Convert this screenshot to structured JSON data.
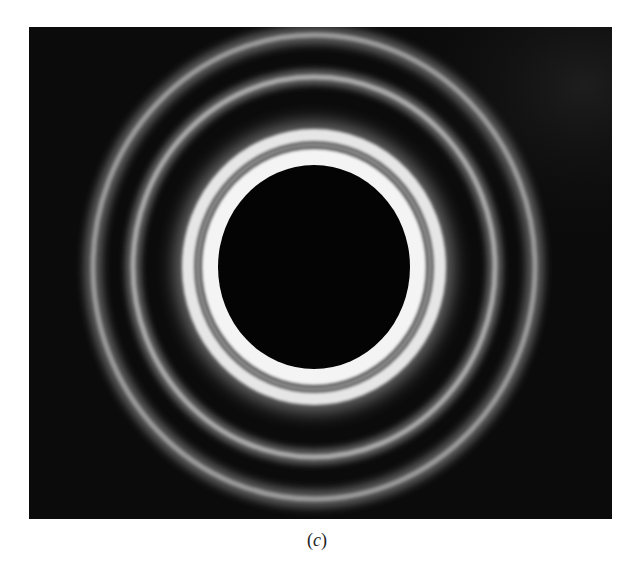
{
  "figure": {
    "background_color": "#0b0b0b",
    "center": {
      "x": 285,
      "y": 240
    },
    "rings": [
      {
        "name": "central-dark-disc",
        "rx": 96,
        "ry": 102,
        "color": "#050505"
      },
      {
        "name": "bright-inner-ring-a",
        "rx": 106,
        "ry": 112,
        "color": "#f2f2f2"
      },
      {
        "name": "bright-inner-ring-b",
        "rx": 124,
        "ry": 130,
        "color": "#e8e8e8"
      },
      {
        "name": "middle-ring",
        "rx": 180,
        "ry": 190,
        "color": "#9a9a9a"
      },
      {
        "name": "outer-ring",
        "rx": 221,
        "ry": 232,
        "color": "#8a8a8a"
      }
    ]
  },
  "caption": {
    "open": "(",
    "label": "c",
    "close": ")"
  }
}
